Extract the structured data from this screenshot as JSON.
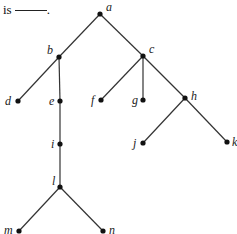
{
  "prompt": {
    "text": "is",
    "blank_suffix": "."
  },
  "tree": {
    "nodes": [
      {
        "id": "a",
        "label": "a",
        "x": 100,
        "y": 14,
        "lx": 6,
        "ly": -3
      },
      {
        "id": "b",
        "label": "b",
        "x": 59,
        "y": 57,
        "lx": -12,
        "ly": -3
      },
      {
        "id": "c",
        "label": "c",
        "x": 143,
        "y": 56,
        "lx": 6,
        "ly": -3
      },
      {
        "id": "d",
        "label": "d",
        "x": 18,
        "y": 101,
        "lx": -13,
        "ly": 4
      },
      {
        "id": "e",
        "label": "e",
        "x": 60,
        "y": 101,
        "lx": -11,
        "ly": 4
      },
      {
        "id": "f",
        "label": "f",
        "x": 101,
        "y": 100,
        "lx": -10,
        "ly": 4
      },
      {
        "id": "g",
        "label": "g",
        "x": 143,
        "y": 100,
        "lx": -11,
        "ly": 4
      },
      {
        "id": "h",
        "label": "h",
        "x": 185,
        "y": 98,
        "lx": 6,
        "ly": 2
      },
      {
        "id": "i",
        "label": "i",
        "x": 60,
        "y": 144,
        "lx": -9,
        "ly": 4
      },
      {
        "id": "j",
        "label": "j",
        "x": 143,
        "y": 143,
        "lx": -10,
        "ly": 4
      },
      {
        "id": "k",
        "label": "k",
        "x": 227,
        "y": 142,
        "lx": 5,
        "ly": 4
      },
      {
        "id": "l",
        "label": "l",
        "x": 60,
        "y": 187,
        "lx": -8,
        "ly": -2
      },
      {
        "id": "m",
        "label": "m",
        "x": 19,
        "y": 231,
        "lx": -15,
        "ly": 3
      },
      {
        "id": "n",
        "label": "n",
        "x": 103,
        "y": 231,
        "lx": 6,
        "ly": 3
      }
    ],
    "edges": [
      [
        "a",
        "b"
      ],
      [
        "a",
        "c"
      ],
      [
        "b",
        "d"
      ],
      [
        "b",
        "e"
      ],
      [
        "c",
        "f"
      ],
      [
        "c",
        "g"
      ],
      [
        "c",
        "h"
      ],
      [
        "e",
        "i"
      ],
      [
        "i",
        "l"
      ],
      [
        "h",
        "j"
      ],
      [
        "h",
        "k"
      ],
      [
        "l",
        "m"
      ],
      [
        "l",
        "n"
      ]
    ]
  }
}
